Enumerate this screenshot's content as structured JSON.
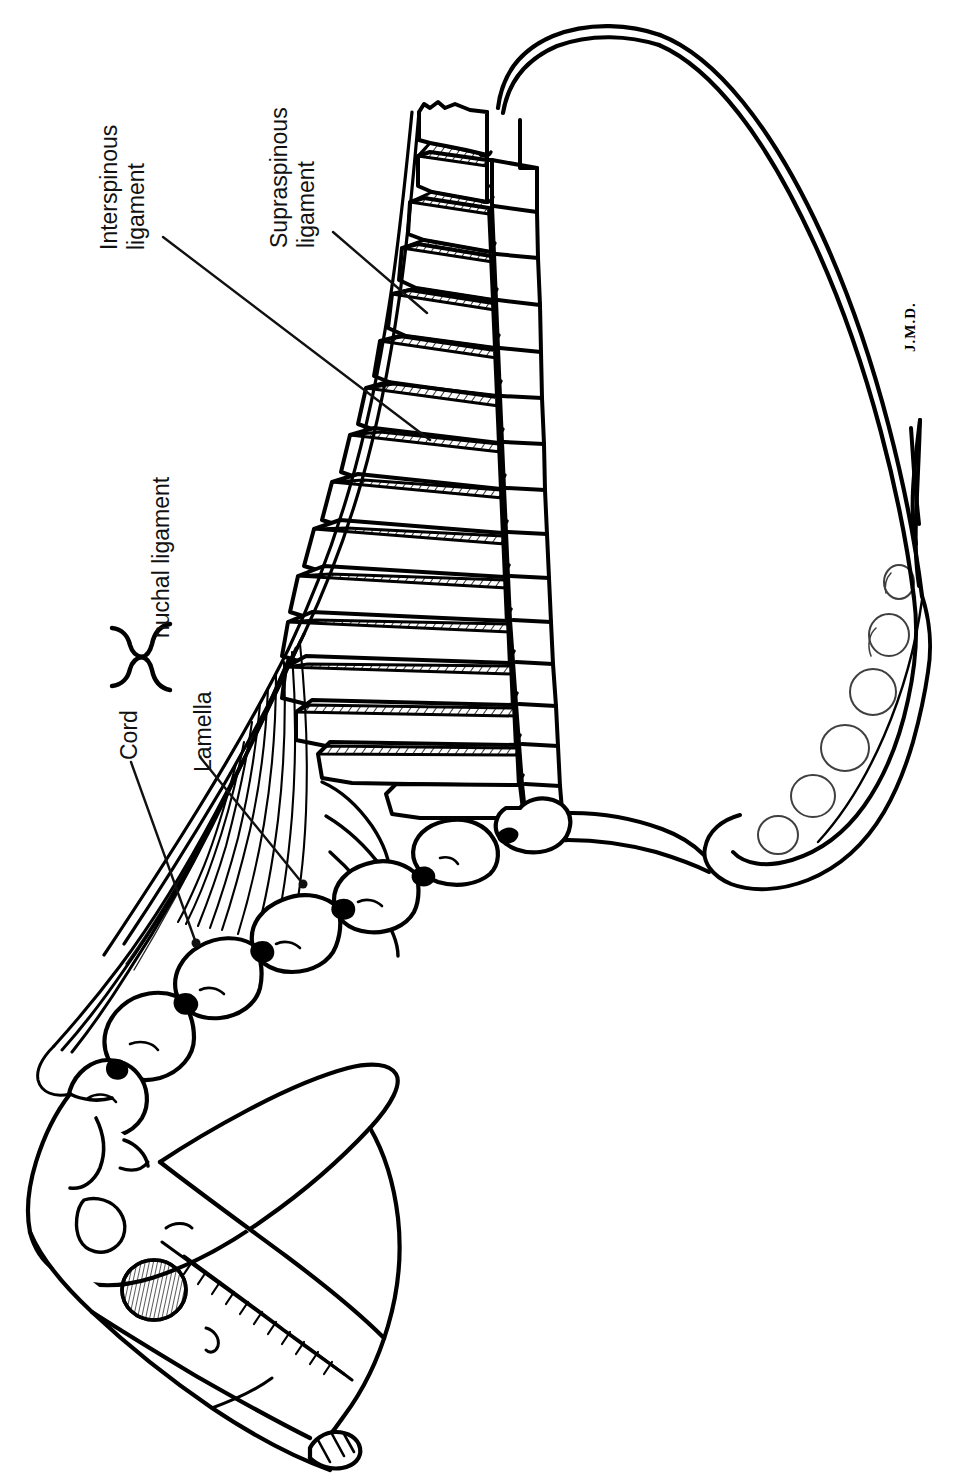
{
  "figure": {
    "orientation_note": "Illustration rotated 90 degrees; labels read bottom-to-top",
    "background_color": "#ffffff",
    "ink_color": "#000000",
    "signature": "J.M.D."
  },
  "labels": {
    "interspinous": {
      "line1": "Interspinous",
      "line2": "ligament"
    },
    "supraspinous": {
      "line1": "Supraspinous",
      "line2": "ligament"
    },
    "nuchal": {
      "line1": "nuchal ligament"
    },
    "cord": {
      "line1": "Cord"
    },
    "lamella": {
      "line1": "Lamella"
    }
  },
  "annotations": {
    "brace_label": "nuchal ligament brace",
    "leaders": [
      {
        "name": "interspinous-leader",
        "from": [
          163,
          237
        ],
        "to": [
          430,
          440
        ]
      },
      {
        "name": "supraspinous-leader",
        "from": [
          333,
          232
        ],
        "to": [
          427,
          313
        ]
      },
      {
        "name": "cord-leader",
        "from": [
          131,
          762
        ],
        "to": [
          196,
          943
        ]
      },
      {
        "name": "lamella-leader",
        "from": [
          200,
          757
        ],
        "to": [
          303,
          884
        ]
      }
    ]
  },
  "structures": {
    "skull": "equine skull, lateral view with orbit and cheek-tooth row",
    "mandible": "mandible with incisors at muzzle tip",
    "cervical_vertebrae": 7,
    "thoracic_vertebrae_shown": 17,
    "scapula": "scapula with scapular cartilage",
    "first_rib": "first rib arching cranially",
    "interspinous_hatching": "hatched bands between dorsal spinous processes",
    "funicular_part": "Cord (funicular part) running from withers to skull",
    "lamellar_part": "Lamella (lamellar part) fanning to cervical vertebrae"
  }
}
